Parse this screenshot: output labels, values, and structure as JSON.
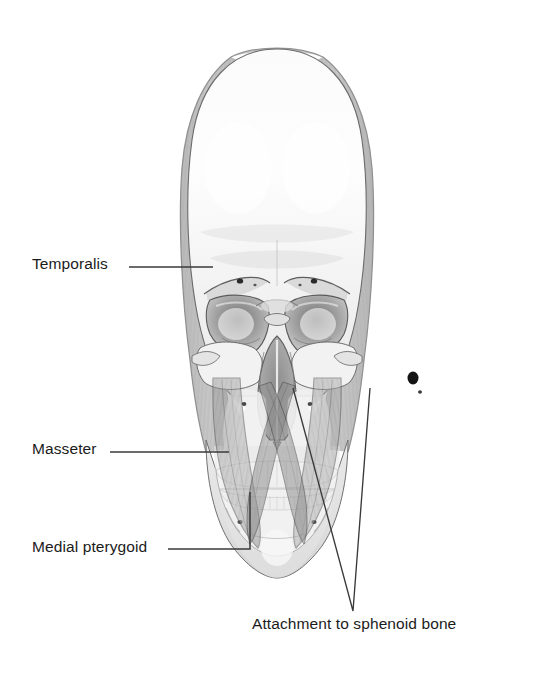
{
  "figure": {
    "background_color": "#ffffff",
    "text_color": "#1b1b1b",
    "leader_line_color": "#3a3a3a"
  },
  "labels": {
    "temporalis": "Temporalis",
    "masseter": "Masseter",
    "medial_pterygoid": "Medial pterygoid",
    "sphenoid_attachment": "Attachment to sphenoid bone"
  },
  "structures": {
    "muscles": [
      {
        "name": "Temporalis",
        "shading": "#9b9b9b",
        "opacity": 0.55,
        "description": "fan-shaped striated band following the lateral contour of the cranial vault, narrowing toward the zygomatic arch"
      },
      {
        "name": "Masseter",
        "shading": "#8f8f8f",
        "opacity": 0.5,
        "description": "translucent quadrangular sheet from zygomatic arch to angle of mandible"
      },
      {
        "name": "Medial pterygoid",
        "shading": "#7d7d7d",
        "opacity": 0.55,
        "description": "deep muscle converging to the medial surface of the mandibular angle"
      }
    ],
    "bone_tones": {
      "cranium": "#f4f4f4",
      "facial_bone": "#ebebeb",
      "shadow": "#cfcfcf",
      "cavity_dark": "#9a9a9a",
      "teeth": "#fdfdfd",
      "outline": "#5a5a5a"
    }
  }
}
